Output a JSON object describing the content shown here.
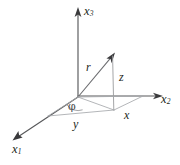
{
  "figure": {
    "background_color": "#ffffff",
    "axis_color": "#58595b",
    "vector_color": "#6d6e71",
    "helper_color": "#a7a9ac",
    "label_color": "#231f20",
    "width": 180,
    "height": 165
  },
  "axes": [
    {
      "id": "x1",
      "name": "x-one-axis",
      "label_base": "x",
      "label_sub": "1",
      "direction": "down-left",
      "origin": [
        78,
        97
      ],
      "tip": [
        14,
        140
      ]
    },
    {
      "id": "x2",
      "name": "x-two-axis",
      "label_base": "x",
      "label_sub": "2",
      "direction": "right",
      "origin": [
        78,
        96
      ],
      "tip": [
        161,
        96
      ]
    },
    {
      "id": "x3",
      "name": "x-three-axis",
      "label_base": "x",
      "label_sub": "3",
      "direction": "up",
      "origin": [
        78,
        97
      ],
      "tip": [
        78,
        9
      ]
    }
  ],
  "vectors": [
    {
      "id": "r",
      "name": "position-vector-r",
      "label": "r",
      "from": [
        78,
        97
      ],
      "to": [
        113,
        55
      ]
    }
  ],
  "components": [
    {
      "id": "z",
      "name": "z-component",
      "label": "z",
      "from": [
        113,
        55
      ],
      "to": [
        114,
        110
      ]
    },
    {
      "id": "x",
      "name": "x-component",
      "label": "x",
      "from": [
        114,
        110
      ],
      "to": [
        143,
        96
      ]
    },
    {
      "id": "y",
      "name": "y-component",
      "label": "y",
      "from": [
        114,
        110
      ],
      "to": [
        48,
        116
      ]
    }
  ],
  "angles": [
    {
      "id": "phi",
      "name": "azimuthal-angle-phi",
      "label": "φ",
      "vertex": [
        78,
        97
      ],
      "between": [
        "x1",
        "projection"
      ]
    }
  ],
  "points": [
    {
      "id": "origin",
      "name": "origin-point",
      "at": [
        78,
        97
      ]
    },
    {
      "id": "tip",
      "name": "vector-tip-point",
      "at": [
        113,
        55
      ]
    },
    {
      "id": "projection",
      "name": "xy-plane-projection-point",
      "at": [
        114,
        110
      ]
    }
  ]
}
